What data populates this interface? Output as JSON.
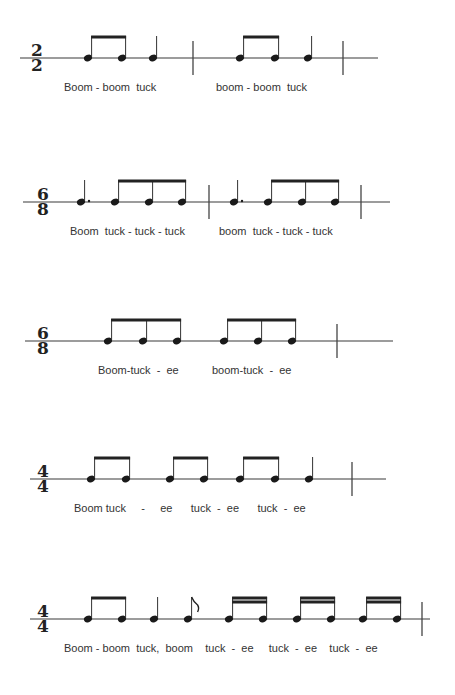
{
  "rhythms": [
    {
      "id": "rhythm-1",
      "time_signature": {
        "top": "2",
        "bottom": "2"
      },
      "staff_y": 58,
      "staff_x": [
        20,
        378
      ],
      "timesig_x": 37,
      "barlines": [
        193,
        343
      ],
      "notes": [
        {
          "x": 88,
          "type": "eighth"
        },
        {
          "x": 122,
          "type": "eighth"
        },
        {
          "x": 153,
          "type": "quarter"
        },
        {
          "x": 240,
          "type": "eighth"
        },
        {
          "x": 275,
          "type": "eighth"
        },
        {
          "x": 308,
          "type": "quarter"
        }
      ],
      "beams": [
        {
          "from": 0,
          "to": 1,
          "count": 1
        },
        {
          "from": 3,
          "to": 4,
          "count": 1
        }
      ],
      "lyrics": [
        {
          "x": 64,
          "text": "Boom - boom  tuck"
        },
        {
          "x": 216,
          "text": "boom - boom  tuck"
        }
      ]
    },
    {
      "id": "rhythm-2",
      "time_signature": {
        "top": "6",
        "bottom": "8"
      },
      "staff_y": 202,
      "staff_x": [
        23,
        390
      ],
      "timesig_x": 43,
      "barlines": [
        209,
        361
      ],
      "notes": [
        {
          "x": 81,
          "type": "dotted-quarter"
        },
        {
          "x": 115,
          "type": "eighth"
        },
        {
          "x": 149,
          "type": "eighth"
        },
        {
          "x": 182,
          "type": "eighth"
        },
        {
          "x": 234,
          "type": "dotted-quarter"
        },
        {
          "x": 268,
          "type": "eighth"
        },
        {
          "x": 302,
          "type": "eighth"
        },
        {
          "x": 335,
          "type": "eighth"
        }
      ],
      "beams": [
        {
          "from": 1,
          "to": 3,
          "count": 1
        },
        {
          "from": 5,
          "to": 7,
          "count": 1
        }
      ],
      "lyrics": [
        {
          "x": 70,
          "text": "Boom  tuck - tuck - tuck"
        },
        {
          "x": 219,
          "text": "boom  tuck - tuck - tuck"
        }
      ]
    },
    {
      "id": "rhythm-3",
      "time_signature": {
        "top": "6",
        "bottom": "8"
      },
      "staff_y": 341,
      "staff_x": [
        25,
        393
      ],
      "timesig_x": 43,
      "barlines": [
        337
      ],
      "notes": [
        {
          "x": 108,
          "type": "eighth"
        },
        {
          "x": 143,
          "type": "eighth"
        },
        {
          "x": 177,
          "type": "eighth"
        },
        {
          "x": 224,
          "type": "eighth"
        },
        {
          "x": 258,
          "type": "eighth"
        },
        {
          "x": 292,
          "type": "eighth"
        }
      ],
      "beams": [
        {
          "from": 0,
          "to": 2,
          "count": 1
        },
        {
          "from": 3,
          "to": 5,
          "count": 1
        }
      ],
      "lyrics": [
        {
          "x": 98,
          "text": "Boom-tuck  -  ee"
        },
        {
          "x": 212,
          "text": "boom-tuck  -  ee"
        }
      ]
    },
    {
      "id": "rhythm-4",
      "time_signature": {
        "top": "4",
        "bottom": "4"
      },
      "staff_y": 479,
      "staff_x": [
        30,
        386
      ],
      "timesig_x": 43,
      "barlines": [
        352
      ],
      "notes": [
        {
          "x": 91,
          "type": "eighth"
        },
        {
          "x": 126,
          "type": "eighth"
        },
        {
          "x": 170,
          "type": "eighth"
        },
        {
          "x": 204,
          "type": "eighth"
        },
        {
          "x": 240,
          "type": "eighth"
        },
        {
          "x": 275,
          "type": "eighth"
        },
        {
          "x": 309,
          "type": "quarter"
        }
      ],
      "beams": [
        {
          "from": 0,
          "to": 1,
          "count": 1
        },
        {
          "from": 2,
          "to": 3,
          "count": 1
        },
        {
          "from": 4,
          "to": 5,
          "count": 1
        }
      ],
      "lyrics": [
        {
          "x": 74,
          "text": "Boom tuck     -     ee      tuck  -  ee      tuck  -  ee"
        }
      ]
    },
    {
      "id": "rhythm-5",
      "time_signature": {
        "top": "4",
        "bottom": "4"
      },
      "staff_y": 619,
      "staff_x": [
        30,
        430
      ],
      "timesig_x": 43,
      "barlines": [
        422
      ],
      "notes": [
        {
          "x": 88,
          "type": "eighth"
        },
        {
          "x": 122,
          "type": "eighth"
        },
        {
          "x": 154,
          "type": "quarter"
        },
        {
          "x": 188,
          "type": "eighth-flag"
        },
        {
          "x": 229,
          "type": "sixteenth"
        },
        {
          "x": 263,
          "type": "sixteenth"
        },
        {
          "x": 297,
          "type": "sixteenth"
        },
        {
          "x": 331,
          "type": "sixteenth"
        },
        {
          "x": 363,
          "type": "sixteenth"
        },
        {
          "x": 397,
          "type": "sixteenth"
        }
      ],
      "beams": [
        {
          "from": 0,
          "to": 1,
          "count": 1
        },
        {
          "from": 4,
          "to": 5,
          "count": 2
        },
        {
          "from": 6,
          "to": 7,
          "count": 2
        },
        {
          "from": 8,
          "to": 9,
          "count": 2
        }
      ],
      "lyrics": [
        {
          "x": 64,
          "text": "Boom - boom  tuck,  boom    tuck  -  ee     tuck  -  ee    tuck  -  ee"
        }
      ]
    }
  ]
}
